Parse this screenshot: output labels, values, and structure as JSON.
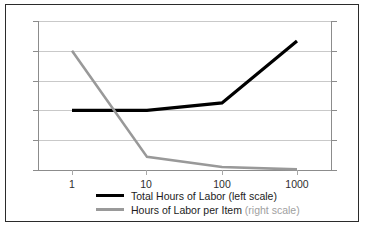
{
  "chart_data": {
    "type": "line",
    "title": "",
    "xlabel": "",
    "ylabel": "",
    "x_scale": "log",
    "x_tick_labels": [
      "1",
      "10",
      "100",
      "1000"
    ],
    "x": [
      1,
      10,
      100,
      1000
    ],
    "left_axis": {
      "label": "",
      "ticks": [
        "0",
        "100",
        "200",
        "300",
        "400",
        "500"
      ],
      "values": [
        0,
        100,
        200,
        300,
        400,
        500
      ],
      "ylim": [
        0,
        500
      ]
    },
    "right_axis": {
      "label": "",
      "ticks": [
        "0",
        "50",
        "100",
        "150",
        "200",
        "250"
      ],
      "values": [
        0,
        50,
        100,
        150,
        200,
        250
      ],
      "ylim": [
        0,
        250
      ]
    },
    "grid": true,
    "legend_position": "bottom",
    "series": [
      {
        "name": "Total Hours of Labor",
        "scale_note": "(left scale)",
        "axis": "left",
        "color": "#000000",
        "values": [
          200,
          200,
          225,
          433
        ]
      },
      {
        "name": "Hours of Labor per Item",
        "scale_note": "(right scale)",
        "axis": "right",
        "color": "#999999",
        "values": [
          200,
          22,
          5,
          1
        ]
      }
    ]
  },
  "axes": {
    "left_ticks": [
      "500",
      "400",
      "300",
      "200",
      "100",
      "0"
    ],
    "right_ticks": [
      "250",
      "200",
      "150",
      "100",
      "50",
      "0"
    ],
    "x_ticks": [
      "1",
      "10",
      "100",
      "1000"
    ]
  },
  "legend": {
    "items": [
      {
        "name": "Total Hours of Labor ",
        "scale": "(left scale)"
      },
      {
        "name": "Hours of Labor per Item ",
        "scale": "(right scale)"
      }
    ]
  }
}
